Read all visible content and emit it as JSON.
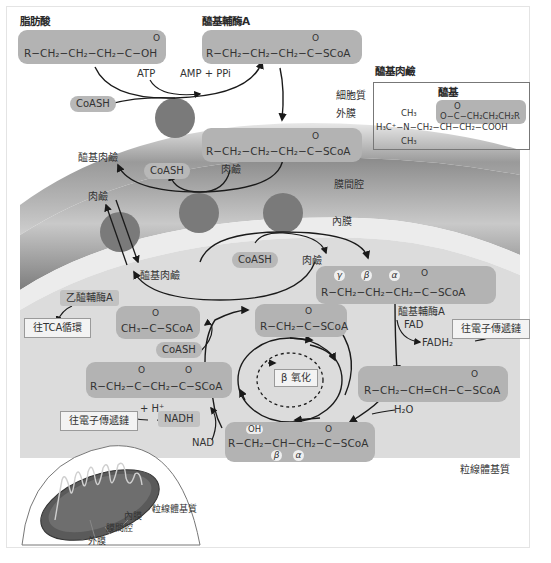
{
  "colors": {
    "box_fill": "#b3b3b3",
    "transporter": "#7a7a7a",
    "membrane_dark": "#8c8c8c",
    "membrane_light": "#d8d8d8",
    "matrix": "#e6e6e6",
    "arrow": "#1a1a1a"
  },
  "cytoplasm": {
    "fatty_acid_title": "脂肪酸",
    "fatty_acid_formula": "R−CH₂−CH₂−CH₂−C−OH",
    "fatty_acid_carbonyl": "O",
    "acyl_coa_title": "醯基輔酶A",
    "acyl_coa_formula": "R−CH₂−CH₂−CH₂−C−SCoA",
    "acyl_coa_carbonyl": "O",
    "atp": "ATP",
    "amp_ppi": "AMP + PPi",
    "coash": "CoASH"
  },
  "acyl_carnitine_inset": {
    "title": "醯基肉鹼",
    "acyl_label": "醯基",
    "acyl_formula": "O−C−CH₂CH₂CH₂R",
    "acyl_carbonyl": "O",
    "backbone": "H₃C⁺−N−CH₂−CH−CH₂−COOH",
    "methyl_top": "CH₃",
    "methyl_bottom": "CH₃"
  },
  "regions": {
    "cytoplasm": "細胞質",
    "outer_membrane": "外膜",
    "intermembrane_space": "膜間腔",
    "inner_membrane": "內膜",
    "matrix": "粒線體基質"
  },
  "intermembrane": {
    "acyl_coa_formula": "R−CH₂−CH₂−CH₂−C−SCoA",
    "acyl_coa_carbonyl": "O",
    "acyl_carnitine": "醯基肉鹼",
    "coash": "CoASH",
    "carnitine": "肉鹼",
    "carnitine_out": "肉鹼"
  },
  "matrix": {
    "acyl_carnitine": "醯基肉鹼",
    "coash": "CoASH",
    "carnitine": "肉鹼",
    "acyl_coa_formula": "R−CH₂−CH₂−CH₂−C−SCoA",
    "acyl_coa_carbonyl": "O",
    "greek": [
      "γ",
      "β",
      "α"
    ],
    "acyl_coa_dehydrogenase": "醯基輔酶A",
    "fad": "FAD",
    "fadh2": "FADH₂",
    "to_etc_1": "往電子傳遞鏈",
    "enoyl_formula": "R−CH₂−CH=CH−C−SCoA",
    "enoyl_carbonyl": "O",
    "h2o": "H₂O",
    "hydroxy_formula": "R−CH₂−CH−CH₂−C−SCoA",
    "hydroxy_oh": "OH",
    "hydroxy_carbonyl": "O",
    "hydroxy_beta": "β",
    "hydroxy_alpha": "α",
    "nad": "NAD",
    "nadh": "NADH",
    "h_plus": "+ H⁺",
    "to_etc_2": "往電子傳遞鏈",
    "keto_formula": "R−CH₂−C−CH₂−C−SCoA",
    "keto_carbonyl_1": "O",
    "keto_carbonyl_2": "O",
    "coash_thiolase": "CoASH",
    "acetyl_coa_formula": "CH₃−C−SCoA",
    "acetyl_coa_carbonyl": "O",
    "acetyl_coa_label": "乙醯輔酶A",
    "to_tca": "往TCA循環",
    "shortened_formula": "R−CH₂−C−SCoA",
    "shortened_carbonyl": "O",
    "beta_oxidation": "β 氧化"
  },
  "mitochondrion_inset": {
    "matrix": "粒線體基質",
    "inner_membrane": "內膜",
    "intermembrane_space": "膜間腔",
    "outer_membrane": "外膜"
  }
}
